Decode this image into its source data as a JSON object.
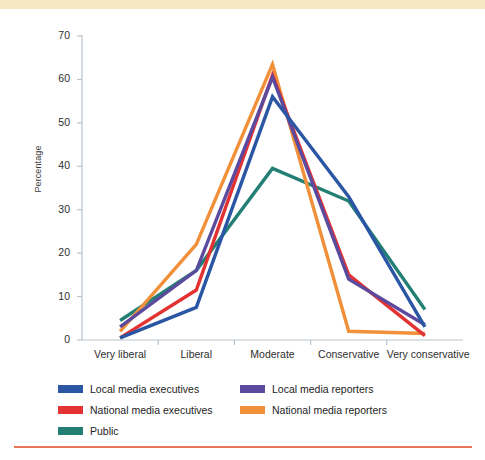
{
  "decor": {
    "top_band_color": "#f5e9c4",
    "bottom_rule_color": "#e8775a"
  },
  "chart_data": {
    "type": "line",
    "title": "",
    "xlabel": "",
    "ylabel": "Percentage",
    "categories": [
      "Very liberal",
      "Liberal",
      "Moderate",
      "Conservative",
      "Very conservative"
    ],
    "ylim": [
      0,
      70
    ],
    "yticks": [
      0,
      10,
      20,
      30,
      40,
      50,
      60,
      70
    ],
    "grid": false,
    "legend_position": "bottom",
    "series": [
      {
        "name": "Local media executives",
        "color": "#2b56a4",
        "values": [
          0.5,
          7.5,
          56,
          33,
          3
        ]
      },
      {
        "name": "Local media reporters",
        "color": "#5b4a9e",
        "values": [
          3,
          16,
          60.5,
          14,
          3.5
        ]
      },
      {
        "name": "National media executives",
        "color": "#e33232",
        "values": [
          0.5,
          11.5,
          61,
          15,
          1
        ]
      },
      {
        "name": "National media reporters",
        "color": "#f29039",
        "values": [
          2,
          22,
          63.5,
          2,
          1.5
        ]
      },
      {
        "name": "Public",
        "color": "#237f74",
        "values": [
          4.5,
          16,
          39.5,
          32,
          7
        ]
      }
    ]
  }
}
